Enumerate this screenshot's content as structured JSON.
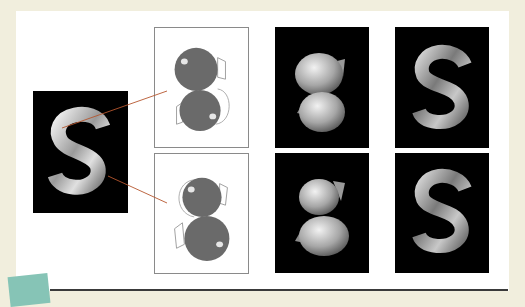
{
  "figure": {
    "source_render": {
      "label": "S",
      "style": "chrome-letter"
    },
    "sketches": [
      {
        "id": "top",
        "style": "two-blob-sketch"
      },
      {
        "id": "bottom",
        "style": "two-blob-sketch"
      }
    ],
    "renders": [
      {
        "row": 1,
        "col": 3,
        "label": "",
        "style": "blob-render"
      },
      {
        "row": 1,
        "col": 4,
        "label": "S",
        "style": "chrome-letter"
      },
      {
        "row": 2,
        "col": 3,
        "label": "",
        "style": "blob-render"
      },
      {
        "row": 2,
        "col": 4,
        "label": "S",
        "style": "chrome-letter"
      }
    ],
    "colors": {
      "background": "#f1eedd",
      "card": "#ffffff",
      "panel": "#000000",
      "blob": "#6a6a6a",
      "leader_line": "#b5562e",
      "sticky": "#86c4b6",
      "rule": "#3a3a3a"
    }
  }
}
